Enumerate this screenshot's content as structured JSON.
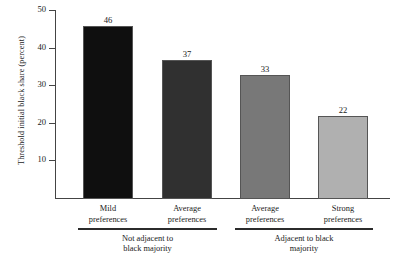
{
  "chart_data": {
    "type": "bar",
    "title": "",
    "subtitle": "",
    "xlabel": "",
    "ylabel": "Threshold initial black share (percent)",
    "ylim": [
      0,
      50
    ],
    "yticks": [
      10,
      20,
      30,
      40,
      50
    ],
    "ytick_labels": [
      "10",
      "20",
      "30",
      "40",
      "50"
    ],
    "grid": false,
    "legend": "none",
    "categories": [
      "Mild preferences",
      "Average preferences",
      "Average preferences",
      "Strong preferences"
    ],
    "values": [
      46,
      37,
      33,
      22
    ],
    "value_labels": [
      "46",
      "37",
      "33",
      "22"
    ],
    "bar_colors": [
      "#0f0f0f",
      "#303030",
      "#787878",
      "#b0b0b0"
    ],
    "groups": [
      {
        "label": "Not adjacent to black majority",
        "label_line1": "Not adjacent to",
        "label_line2": "black majority",
        "category_indices": [
          0,
          1
        ]
      },
      {
        "label": "Adjacent to black majority",
        "label_line1": "Adjacent to black",
        "label_line2": "majority",
        "category_indices": [
          2,
          3
        ]
      }
    ]
  },
  "axis": {
    "ticks": [
      {
        "label": "50",
        "value": 50
      },
      {
        "label": "40",
        "value": 40
      },
      {
        "label": "30",
        "value": 30
      },
      {
        "label": "20",
        "value": 20
      },
      {
        "label": "10",
        "value": 10
      }
    ],
    "title": "Threshold initial black share (percent)"
  },
  "bars": [
    {
      "value_label": "46",
      "value": 46,
      "cat_line1": "Mild",
      "cat_line2": "preferences",
      "color": "#0f0f0f"
    },
    {
      "value_label": "37",
      "value": 37,
      "cat_line1": "Average",
      "cat_line2": "preferences",
      "color": "#303030"
    },
    {
      "value_label": "33",
      "value": 33,
      "cat_line1": "Average",
      "cat_line2": "preferences",
      "color": "#787878"
    },
    {
      "value_label": "22",
      "value": 22,
      "cat_line1": "Strong",
      "cat_line2": "preferences",
      "color": "#b0b0b0"
    }
  ],
  "groups": [
    {
      "line1": "Not adjacent to",
      "line2": "black majority"
    },
    {
      "line1": "Adjacent to black",
      "line2": "majority"
    }
  ]
}
